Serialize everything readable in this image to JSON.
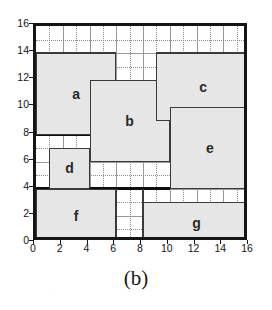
{
  "figure": {
    "caption": "(b)",
    "grid_max": 16
  },
  "axes": {
    "x": {
      "min": 0,
      "max": 16,
      "ticks": [
        0,
        2,
        4,
        6,
        8,
        10,
        12,
        14,
        16
      ],
      "tick_labels": [
        "0",
        "2",
        "4",
        "6",
        "8",
        "10",
        "12",
        "14",
        "16"
      ]
    },
    "y": {
      "min": 0,
      "max": 16,
      "ticks": [
        0,
        2,
        4,
        6,
        8,
        10,
        12,
        14,
        16
      ],
      "tick_labels": [
        "0",
        "2",
        "4",
        "6",
        "8",
        "10",
        "12",
        "14",
        "16"
      ]
    }
  },
  "chart_data": {
    "type": "table",
    "title": "",
    "subtitle": "",
    "xlabel": "",
    "ylabel": "",
    "xlim": [
      0,
      16
    ],
    "ylim": [
      0,
      16
    ],
    "grid": true,
    "grid_step": 1,
    "legend": "none",
    "annotations": [
      "(b)"
    ],
    "categories": [
      "a",
      "b",
      "c",
      "d",
      "e",
      "f",
      "g"
    ],
    "values": [
      36,
      36,
      35,
      9,
      36,
      24,
      24
    ],
    "rectangles": [
      {
        "label": "a",
        "x": 0,
        "y": 8,
        "width": 6,
        "height": 6,
        "area": 36,
        "heavy": false
      },
      {
        "label": "b",
        "x": 4,
        "y": 6,
        "width": 6,
        "height": 6,
        "area": 36,
        "heavy": false
      },
      {
        "label": "c",
        "x": 9,
        "y": 9,
        "width": 7,
        "height": 5,
        "area": 35,
        "heavy": false
      },
      {
        "label": "d",
        "x": 1,
        "y": 4,
        "width": 3,
        "height": 3,
        "area": 9,
        "heavy": false
      },
      {
        "label": "e",
        "x": 10,
        "y": 4,
        "width": 6,
        "height": 6,
        "area": 36,
        "heavy": false
      },
      {
        "label": "f",
        "x": 0,
        "y": 0,
        "width": 6,
        "height": 4,
        "area": 24,
        "heavy": false
      },
      {
        "label": "g",
        "x": 8,
        "y": 0,
        "width": 8,
        "height": 3,
        "area": 24,
        "heavy": false
      }
    ],
    "guide_lines": [
      {
        "orientation": "horizontal",
        "value": 8,
        "from": 0,
        "to": 4,
        "weight": "heavy"
      },
      {
        "orientation": "horizontal",
        "value": 8,
        "from": 10,
        "to": 16,
        "weight": "heavy"
      },
      {
        "orientation": "horizontal",
        "value": 4,
        "from": 0,
        "to": 10,
        "weight": "heavy"
      },
      {
        "orientation": "horizontal",
        "value": 14,
        "from": 0,
        "to": 6,
        "weight": "medium"
      },
      {
        "orientation": "horizontal",
        "value": 14,
        "from": 9,
        "to": 16,
        "weight": "medium"
      },
      {
        "orientation": "vertical",
        "value": 6,
        "from": 0,
        "to": 4,
        "weight": "medium"
      },
      {
        "orientation": "vertical",
        "value": 8,
        "from": 0,
        "to": 4,
        "weight": "medium"
      }
    ]
  }
}
